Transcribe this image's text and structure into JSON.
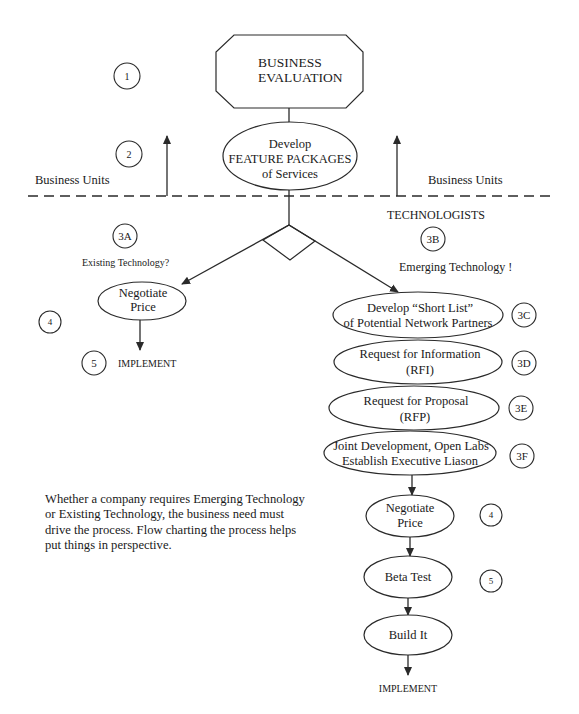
{
  "diagram": {
    "nodes": {
      "business_evaluation": {
        "line1": "BUSINESS",
        "line2": "EVALUATION"
      },
      "feature_packages": {
        "line1": "Develop",
        "line2": "FEATURE PACKAGES",
        "line3": "of Services"
      },
      "negotiate_left": {
        "line1": "Negotiate",
        "line2": "Price"
      },
      "short_list": {
        "line1": "Develop “Short List”",
        "line2": "of Potential Network Partners"
      },
      "rfi": {
        "line1": "Request for Information",
        "line2": "(RFI)"
      },
      "rfp": {
        "line1": "Request for Proposal",
        "line2": "(RFP)"
      },
      "joint_dev": {
        "line1": "Joint Development, Open Labs",
        "line2": "Establish Executive Liason"
      },
      "negotiate_right": {
        "line1": "Negotiate",
        "line2": "Price"
      },
      "beta_test": {
        "label": "Beta Test"
      },
      "build_it": {
        "label": "Build It"
      }
    },
    "step_markers": {
      "m1": "1",
      "m2": "2",
      "m3a": "3A",
      "m3b": "3B",
      "m3c": "3C",
      "m3d": "3D",
      "m3e": "3E",
      "m3f": "3F",
      "m4_left": "4",
      "m5_left": "5",
      "m4_right": "4",
      "m5_right": "5"
    },
    "labels": {
      "business_units_left": "Business Units",
      "business_units_right": "Business Units",
      "technologists": "TECHNOLOGISTS",
      "existing_technology": "Existing Technology?",
      "emerging_technology": "Emerging Technology !",
      "implement_left": "IMPLEMENT",
      "implement_right": "IMPLEMENT"
    },
    "note": {
      "line1": "Whether a company requires Emerging Technology",
      "line2": "or Existing Technology, the business need must",
      "line3": "drive the process.  Flow charting the process helps",
      "line4": "put things in perspective."
    }
  }
}
